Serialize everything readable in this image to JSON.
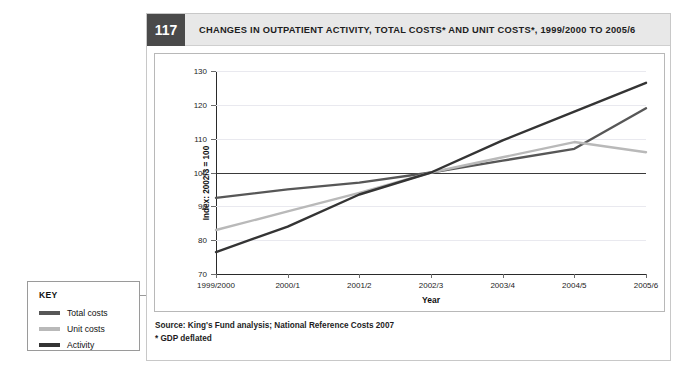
{
  "figure": {
    "number": "117",
    "title": "CHANGES IN OUTPATIENT ACTIVITY, TOTAL COSTS* AND UNIT COSTS*, 1999/2000 TO 2005/6",
    "source_line_1": "Source: King's Fund analysis; National Reference Costs 2007",
    "source_line_2": "* GDP deflated"
  },
  "key": {
    "title": "KEY",
    "items": [
      {
        "label": "Total costs",
        "color": "#575757"
      },
      {
        "label": "Unit costs",
        "color": "#b9b9b9"
      },
      {
        "label": "Activity",
        "color": "#343434"
      }
    ]
  },
  "chart_data": {
    "type": "line",
    "title": "CHANGES IN OUTPATIENT ACTIVITY, TOTAL COSTS* AND UNIT COSTS*, 1999/2000 TO 2005/6",
    "xlabel": "Year",
    "ylabel": "Index: 2002/3 = 100",
    "categories": [
      "1999/2000",
      "2000/1",
      "2001/2",
      "2002/3",
      "2003/4",
      "2004/5",
      "2005/6"
    ],
    "ylim": [
      70,
      130
    ],
    "yticks": [
      70,
      80,
      90,
      100,
      110,
      120,
      130
    ],
    "grid": true,
    "legend_position": "outside-left",
    "reference_line": 100,
    "series": [
      {
        "name": "Total costs",
        "color": "#575757",
        "values": [
          92.5,
          95.0,
          97.0,
          100.0,
          103.5,
          107.0,
          119.0
        ]
      },
      {
        "name": "Unit costs",
        "color": "#b9b9b9",
        "values": [
          83.0,
          88.5,
          94.0,
          100.0,
          104.5,
          109.0,
          106.0
        ]
      },
      {
        "name": "Activity",
        "color": "#343434",
        "values": [
          76.5,
          84.0,
          93.5,
          100.0,
          109.5,
          118.0,
          126.5
        ]
      }
    ]
  }
}
